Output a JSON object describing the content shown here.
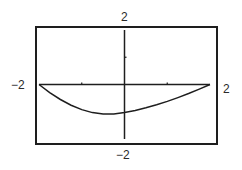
{
  "chart_data": {
    "type": "line",
    "title": "",
    "xlabel": "",
    "ylabel": "",
    "xlim": [
      -2,
      2
    ],
    "ylim": [
      -2,
      2
    ],
    "grid": false,
    "legend": null,
    "x_ticks": [
      -1,
      0,
      1
    ],
    "y_ticks": [
      1
    ],
    "window_labels": {
      "xmin": "−2",
      "xmax": "2",
      "ymin": "−2",
      "ymax": "2"
    },
    "series": [
      {
        "name": "curve",
        "x": [
          -2,
          -1.75,
          -1.5,
          -1.25,
          -1,
          -0.75,
          -0.5,
          -0.25,
          0,
          0.25,
          0.5,
          0.75,
          1,
          1.25,
          1.5,
          1.75,
          2
        ],
        "y": [
          0,
          -0.3,
          -0.55,
          -0.76,
          -0.92,
          -1.03,
          -1.08,
          -1.08,
          -1.03,
          -0.95,
          -0.85,
          -0.74,
          -0.62,
          -0.48,
          -0.33,
          -0.17,
          0
        ]
      }
    ]
  },
  "colors": {
    "line": "#1e1e1e",
    "frame": "#1e1e1e",
    "background": "#ffffff"
  }
}
